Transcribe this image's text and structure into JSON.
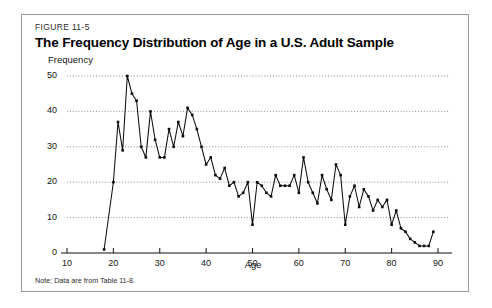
{
  "figure": {
    "number": "FIGURE 11-5",
    "title": "The Frequency Distribution of Age in a U.S. Adult Sample",
    "note": "Note: Data are from Table 11-8."
  },
  "chart_data": {
    "type": "line",
    "title": "The Frequency Distribution of Age in a U.S. Adult Sample",
    "xlabel": "Age",
    "ylabel": "Frequency",
    "xlim": [
      10,
      90
    ],
    "ylim": [
      0,
      50
    ],
    "xticks": [
      10,
      20,
      30,
      40,
      50,
      60,
      70,
      80,
      90
    ],
    "yticks": [
      0,
      10,
      20,
      30,
      40,
      50
    ],
    "grid": "horizontal-dotted",
    "legend": "none",
    "markers": true,
    "x": [
      18,
      20,
      21,
      22,
      23,
      24,
      25,
      26,
      27,
      28,
      29,
      30,
      31,
      32,
      33,
      34,
      35,
      36,
      37,
      38,
      39,
      40,
      41,
      42,
      43,
      44,
      45,
      46,
      47,
      48,
      49,
      50,
      51,
      52,
      53,
      54,
      55,
      56,
      57,
      58,
      59,
      60,
      61,
      62,
      63,
      64,
      65,
      66,
      67,
      68,
      69,
      70,
      71,
      72,
      73,
      74,
      75,
      76,
      77,
      78,
      79,
      80,
      81,
      82,
      83,
      84,
      85,
      86,
      87,
      88,
      89
    ],
    "y": [
      1,
      20,
      37,
      29,
      50,
      45,
      43,
      30,
      27,
      40,
      32,
      27,
      27,
      35,
      30,
      37,
      33,
      41,
      39,
      35,
      30,
      25,
      27,
      22,
      21,
      24,
      19,
      20,
      16,
      17,
      20,
      8,
      20,
      19,
      17,
      16,
      22,
      19,
      19,
      19,
      22,
      17,
      27,
      20,
      17,
      14,
      22,
      18,
      15,
      25,
      22,
      8,
      16,
      19,
      13,
      18,
      16,
      12,
      15,
      13,
      15,
      8,
      12,
      7,
      6,
      4,
      3,
      2,
      2,
      2,
      6
    ],
    "series": [
      {
        "name": "Frequency of age",
        "values": [
          1,
          20,
          37,
          29,
          50,
          45,
          43,
          30,
          27,
          40,
          32,
          27,
          27,
          35,
          30,
          37,
          33,
          41,
          39,
          35,
          30,
          25,
          27,
          22,
          21,
          24,
          19,
          20,
          16,
          17,
          20,
          8,
          20,
          19,
          17,
          16,
          22,
          19,
          19,
          19,
          22,
          17,
          27,
          20,
          17,
          14,
          22,
          18,
          15,
          25,
          22,
          8,
          16,
          19,
          13,
          18,
          16,
          12,
          15,
          13,
          15,
          8,
          12,
          7,
          6,
          4,
          3,
          2,
          2,
          2,
          6
        ]
      }
    ],
    "colors": {
      "line": "#0d0d0d",
      "grid": "#6e6e6e",
      "axis": "#111111",
      "background": "#ffffff"
    }
  }
}
